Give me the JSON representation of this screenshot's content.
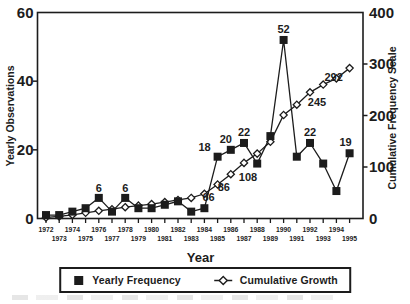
{
  "figure": {
    "background": "#ffffff",
    "ink_color": "#1c1c1c"
  },
  "chart_data": {
    "type": "line",
    "title": "",
    "xlabel": "Year",
    "ylabel_left": "Yearly Observations",
    "ylabel_right": "Cumulative Frequency Scale",
    "x": [
      1972,
      1973,
      1974,
      1975,
      1976,
      1977,
      1978,
      1979,
      1980,
      1981,
      1982,
      1983,
      1984,
      1985,
      1986,
      1987,
      1988,
      1989,
      1990,
      1991,
      1992,
      1993,
      1994,
      1995
    ],
    "left_axis": {
      "min": 0,
      "max": 60,
      "ticks": [
        0,
        20,
        40,
        60
      ]
    },
    "right_axis": {
      "min": 0,
      "max": 400,
      "ticks": [
        0,
        100,
        200,
        300,
        400
      ]
    },
    "grid": false,
    "series": [
      {
        "name": "Yearly Frequency",
        "axis": "left",
        "marker": "filled-square",
        "values": [
          1,
          1,
          2,
          3,
          6,
          2,
          6,
          3,
          3,
          4,
          5,
          2,
          3,
          18,
          20,
          22,
          16,
          24,
          52,
          18,
          22,
          16,
          8,
          19
        ],
        "point_labels": [
          {
            "year": 1976,
            "text": "6",
            "dx": 0,
            "dy": -6
          },
          {
            "year": 1978,
            "text": "6",
            "dx": 0,
            "dy": -6
          },
          {
            "year": 1985,
            "text": "18",
            "dx": -13,
            "dy": -6
          },
          {
            "year": 1986,
            "text": "20",
            "dx": -5,
            "dy": -7
          },
          {
            "year": 1987,
            "text": "22",
            "dx": 0,
            "dy": -7
          },
          {
            "year": 1990,
            "text": "52",
            "dx": 0,
            "dy": -7
          },
          {
            "year": 1992,
            "text": "22",
            "dx": 0,
            "dy": -7
          },
          {
            "year": 1995,
            "text": "19",
            "dx": -4,
            "dy": -7
          }
        ]
      },
      {
        "name": "Cumulative Growth",
        "axis": "right",
        "marker": "open-diamond",
        "values": [
          2,
          4,
          7,
          11,
          15,
          18,
          22,
          25,
          28,
          32,
          36,
          40,
          48,
          66,
          86,
          108,
          126,
          149,
          201,
          221,
          245,
          260,
          272,
          292
        ],
        "point_labels": [
          {
            "year": 1985,
            "text": "66",
            "dx": -9,
            "dy": 16
          },
          {
            "year": 1986,
            "text": "86",
            "dx": -7,
            "dy": 17
          },
          {
            "year": 1987,
            "text": "108",
            "dx": 4,
            "dy": 18
          },
          {
            "year": 1992,
            "text": "245",
            "dx": 7,
            "dy": 14
          },
          {
            "year": 1995,
            "text": "292",
            "dx": -16,
            "dy": 13
          }
        ]
      }
    ],
    "legend": {
      "position": "bottom-center",
      "entries": [
        "Yearly Frequency",
        "Cumulative Growth"
      ]
    }
  }
}
